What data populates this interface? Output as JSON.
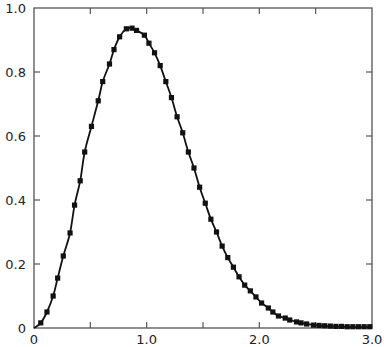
{
  "chart_data": {
    "type": "line",
    "title": "",
    "xlabel": "",
    "ylabel": "",
    "xlim": [
      0,
      3.0
    ],
    "ylim": [
      0,
      1.0
    ],
    "grid": false,
    "legend": null,
    "x_ticks": [
      0,
      0.5,
      1.0,
      1.5,
      2.0,
      2.5,
      3.0
    ],
    "x_tick_labels": [
      "0",
      "",
      "1.0",
      "",
      "2.0",
      "",
      "3.0"
    ],
    "y_ticks": [
      0,
      0.2,
      0.4,
      0.6,
      0.8,
      1.0
    ],
    "y_tick_labels": [
      "0",
      "0.2",
      "0.4",
      "0.6",
      "0.8",
      "1.0"
    ],
    "series": [
      {
        "name": "fit (solid line)",
        "style": "line",
        "color": "#111111",
        "x": [
          0,
          0.06,
          0.115,
          0.17,
          0.21,
          0.26,
          0.32,
          0.36,
          0.41,
          0.45,
          0.51,
          0.57,
          0.61,
          0.67,
          0.71,
          0.76,
          0.82,
          0.87,
          0.91,
          0.98,
          1.02,
          1.07,
          1.12,
          1.17,
          1.22,
          1.27,
          1.32,
          1.37,
          1.42,
          1.47,
          1.52,
          1.57,
          1.62,
          1.67,
          1.72,
          1.77,
          1.82,
          1.87,
          1.92,
          1.97,
          2.02,
          2.08,
          2.12,
          2.17,
          2.23,
          2.27,
          2.33,
          2.37,
          2.42,
          2.48,
          2.55,
          2.65,
          2.75,
          2.85,
          3.0
        ],
        "y": [
          0,
          0.016,
          0.05,
          0.1,
          0.156,
          0.225,
          0.297,
          0.384,
          0.46,
          0.55,
          0.63,
          0.71,
          0.77,
          0.825,
          0.87,
          0.91,
          0.935,
          0.937,
          0.93,
          0.915,
          0.89,
          0.86,
          0.82,
          0.77,
          0.72,
          0.66,
          0.61,
          0.55,
          0.5,
          0.44,
          0.39,
          0.34,
          0.3,
          0.256,
          0.22,
          0.19,
          0.16,
          0.134,
          0.116,
          0.097,
          0.078,
          0.0625,
          0.05,
          0.0375,
          0.031,
          0.025,
          0.019,
          0.016,
          0.0125,
          0.009,
          0.007,
          0.005,
          0.004,
          0.003,
          0.003
        ]
      },
      {
        "name": "data (square markers)",
        "style": "markers",
        "marker": "square",
        "color": "#111111",
        "x": [
          0.06,
          0.115,
          0.17,
          0.21,
          0.26,
          0.32,
          0.36,
          0.41,
          0.45,
          0.51,
          0.57,
          0.61,
          0.67,
          0.71,
          0.76,
          0.82,
          0.87,
          0.91,
          0.98,
          1.02,
          1.07,
          1.12,
          1.17,
          1.22,
          1.27,
          1.32,
          1.37,
          1.42,
          1.47,
          1.52,
          1.57,
          1.62,
          1.67,
          1.72,
          1.77,
          1.82,
          1.87,
          1.92,
          1.97,
          2.02,
          2.08,
          2.12,
          2.17,
          2.23,
          2.27,
          2.33,
          2.37,
          2.42,
          2.48,
          2.53,
          2.58,
          2.63,
          2.68,
          2.73,
          2.78,
          2.83,
          2.88,
          2.93,
          2.98
        ],
        "y": [
          0.016,
          0.05,
          0.1,
          0.156,
          0.225,
          0.297,
          0.384,
          0.46,
          0.55,
          0.63,
          0.71,
          0.77,
          0.825,
          0.87,
          0.91,
          0.935,
          0.937,
          0.93,
          0.915,
          0.89,
          0.86,
          0.82,
          0.77,
          0.72,
          0.66,
          0.61,
          0.55,
          0.5,
          0.44,
          0.39,
          0.34,
          0.3,
          0.256,
          0.22,
          0.19,
          0.16,
          0.134,
          0.116,
          0.097,
          0.078,
          0.0625,
          0.05,
          0.0375,
          0.031,
          0.025,
          0.019,
          0.016,
          0.0125,
          0.009,
          0.008,
          0.007,
          0.006,
          0.005,
          0.005,
          0.004,
          0.004,
          0.004,
          0.004,
          0.004
        ]
      }
    ]
  },
  "style": {
    "axis_color": "#555555",
    "line_color": "#111111",
    "background": "#ffffff"
  }
}
